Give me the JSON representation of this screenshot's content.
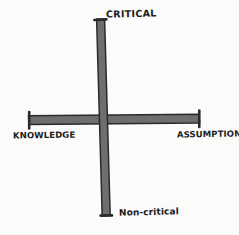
{
  "diagram": {
    "style": "hand-drawn marker sketch",
    "background_color": "#fbfbfa",
    "stroke_fill_color": "#6e6e6e",
    "stroke_outline_color": "#2b2b2b",
    "text_color": "#1c1c1c",
    "axes": [
      {
        "name": "vertical-axis",
        "orientation": "vertical",
        "positive_label": "CRITICAL",
        "negative_label": "Non-critical",
        "cap_top": "bracket-cap",
        "cap_bottom": "bracket-cap"
      },
      {
        "name": "horizontal-axis",
        "orientation": "horizontal",
        "negative_label": "KNOWLEDGE",
        "positive_label": "ASSUMPTION",
        "cap_left": "bracket-cap",
        "cap_right": "bracket-cap"
      }
    ],
    "labels": {
      "top": "CRITICAL",
      "bottom": "Non-critical",
      "left": "KNOWLEDGE",
      "right": "ASSUMPTION"
    }
  }
}
